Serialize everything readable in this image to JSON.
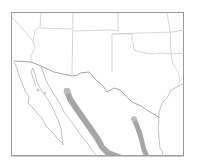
{
  "map": {
    "title": "",
    "region": "Southwestern United States and Northern Mexico",
    "colors": {
      "background": "#ffffff",
      "frame": "#9a9a9a",
      "state_lines": "#c4c4c4",
      "coast_lines": "#a8a8a8",
      "range_band": "#a6a6a6",
      "range_band_tip": "#bcbcbc"
    },
    "layers": [
      {
        "name": "range-band-west",
        "description": "Gray band running NW to SE through western Mexico (Sierra Madre Occidental area)"
      },
      {
        "name": "range-band-east",
        "description": "Gray band running N to S through northeastern Mexico"
      }
    ]
  }
}
